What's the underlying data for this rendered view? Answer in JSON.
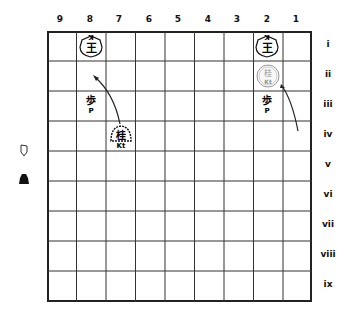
{
  "board": {
    "files": [
      "9",
      "8",
      "7",
      "6",
      "5",
      "4",
      "3",
      "2",
      "1"
    ],
    "ranks": [
      "i",
      "ii",
      "iii",
      "iv",
      "v",
      "vi",
      "vii",
      "viii",
      "ix"
    ],
    "pieces": [
      {
        "id": "king-8i",
        "kanji": "王",
        "label": "K",
        "file": "8",
        "rank": "i",
        "owner": "opponent",
        "type": "king"
      },
      {
        "id": "king-2i",
        "kanji": "王",
        "label": "K",
        "file": "2",
        "rank": "i",
        "owner": "opponent",
        "type": "king"
      },
      {
        "id": "knight-2ii",
        "kanji": "桂",
        "label": "Kt",
        "file": "2",
        "rank": "ii",
        "owner": "player",
        "type": "knight",
        "ghost": true
      },
      {
        "id": "pawn-8iii",
        "kanji": "歩",
        "label": "P",
        "file": "8",
        "rank": "iii",
        "owner": "opponent",
        "type": "pawn"
      },
      {
        "id": "pawn-2iii",
        "kanji": "歩",
        "label": "P",
        "file": "2",
        "rank": "iii",
        "owner": "opponent",
        "type": "pawn"
      },
      {
        "id": "knight-7iv",
        "kanji": "桂",
        "label": "Kt",
        "file": "7",
        "rank": "iv",
        "owner": "player",
        "type": "knight"
      }
    ],
    "arrows": [
      {
        "from": "7iv",
        "to": "8ii"
      },
      {
        "from": "1iv",
        "to": "2ii"
      }
    ]
  },
  "legend": {
    "white_symbol": "white-player-icon",
    "black_symbol": "black-player-icon"
  }
}
